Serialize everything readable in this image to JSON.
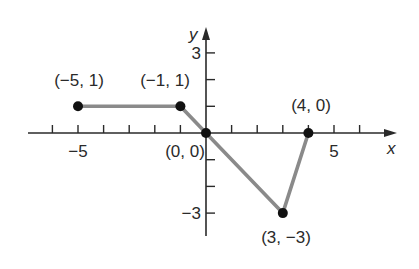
{
  "chart_data": {
    "type": "line",
    "title": "",
    "xlabel": "x",
    "ylabel": "y",
    "xlim": [
      -7,
      7
    ],
    "ylim": [
      -4,
      4
    ],
    "grid": false,
    "x_ticks": [
      -6,
      -5,
      -4,
      -3,
      -2,
      -1,
      1,
      2,
      3,
      4,
      5,
      6
    ],
    "y_ticks": [
      -3,
      -2,
      -1,
      1,
      2,
      3
    ],
    "x_tick_labels": [
      {
        "value": -5,
        "text": "−5"
      },
      {
        "value": 5,
        "text": "5"
      }
    ],
    "y_tick_labels": [
      {
        "value": 3,
        "text": "3"
      },
      {
        "value": -3,
        "text": "−3"
      }
    ],
    "series": [
      {
        "name": "piecewise",
        "x": [
          -5,
          -1,
          0,
          3,
          4
        ],
        "y": [
          1,
          1,
          0,
          -3,
          0
        ],
        "color": "#8a8a8a"
      }
    ],
    "points": [
      {
        "x": -5,
        "y": 1,
        "label": "(−5, 1)"
      },
      {
        "x": -1,
        "y": 1,
        "label": "(−1, 1)"
      },
      {
        "x": 0,
        "y": 0,
        "label": "(0, 0)"
      },
      {
        "x": 3,
        "y": -3,
        "label": "(3, −3)"
      },
      {
        "x": 4,
        "y": 0,
        "label": "(4, 0)"
      }
    ]
  },
  "colors": {
    "axis": "#2a2a2a",
    "line": "#8a8a8a",
    "point": "#111111"
  }
}
